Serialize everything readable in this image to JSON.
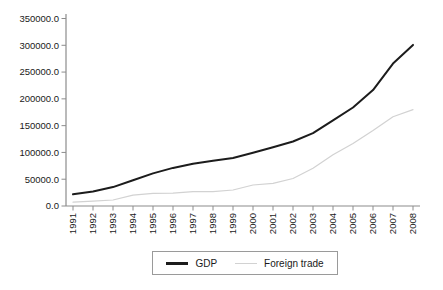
{
  "chart_data": {
    "type": "line",
    "title": "",
    "xlabel": "",
    "ylabel": "",
    "categories": [
      "1991",
      "1992",
      "1993",
      "1994",
      "1995",
      "1996",
      "1997",
      "1998",
      "1999",
      "2000",
      "2001",
      "2002",
      "2003",
      "2004",
      "2005",
      "2006",
      "2007",
      "2008"
    ],
    "series": [
      {
        "name": "GDP",
        "color": "#1c1c1c",
        "stroke_width": 2,
        "values": [
          21781.5,
          26923.5,
          35333.9,
          48197.9,
          60793.7,
          71176.6,
          78973.0,
          84402.3,
          89677.1,
          99214.6,
          109655.2,
          120332.7,
          135822.8,
          159878.3,
          183867.9,
          216314.4,
          265810.3,
          300670.0
        ]
      },
      {
        "name": "Foreign trade",
        "color": "#d2d2d2",
        "stroke_width": 1.2,
        "values": [
          7225.8,
          9119.6,
          11271.0,
          20381.9,
          23499.9,
          24133.8,
          26967.2,
          26849.7,
          29896.2,
          39273.2,
          42183.6,
          51378.2,
          70483.5,
          95539.1,
          116921.8,
          140974.0,
          166740.2,
          179921.5
        ]
      }
    ],
    "ylim": [
      0,
      350000
    ],
    "ytick_step": 50000,
    "ytick_labels": [
      "0.0",
      "50000.0",
      "100000.0",
      "150000.0",
      "200000.0",
      "250000.0",
      "300000.0",
      "350000.0"
    ],
    "grid": false,
    "legend_position": "bottom-center-boxed",
    "axis_color": "#8c8c8c",
    "tick_text_color": "#1a1a1a",
    "background_color": "#ffffff"
  }
}
